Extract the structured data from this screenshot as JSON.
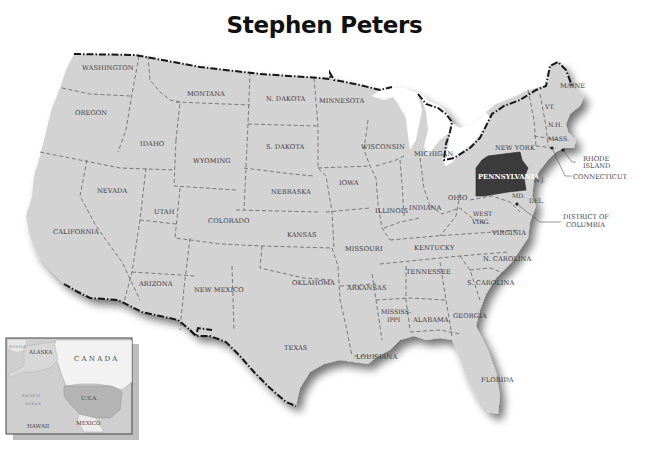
{
  "title": "Stephen Peters",
  "highlight": {
    "state": "PENNSYLVANIA",
    "fill": "#3b3b3b"
  },
  "colors": {
    "land": "#d2d2d2",
    "border": "#6a6a6a",
    "intl_border": "#1a1a1a",
    "background": "#ffffff"
  },
  "states": {
    "washington": "WASHINGTON",
    "oregon": "OREGON",
    "california": "CALIFORNIA",
    "nevada": "NEVADA",
    "idaho": "IDAHO",
    "montana": "MONTANA",
    "wyoming": "WYOMING",
    "utah": "UTAH",
    "arizona": "ARIZONA",
    "colorado": "COLORADO",
    "new_mexico": "NEW MEXICO",
    "n_dakota": "N. DAKOTA",
    "s_dakota": "S. DAKOTA",
    "nebraska": "NEBRASKA",
    "kansas": "KANSAS",
    "oklahoma": "OKLAHOMA",
    "texas": "TEXAS",
    "minnesota": "MINNESOTA",
    "iowa": "IOWA",
    "missouri": "MISSOURI",
    "arkansas": "ARKANSAS",
    "louisiana": "LOUISIANA",
    "wisconsin": "WISCONSIN",
    "illinois": "ILLINOIS",
    "michigan": "MICHIGAN",
    "indiana": "INDIANA",
    "ohio": "OHIO",
    "kentucky": "KENTUCKY",
    "tennessee": "TENNESSEE",
    "mississippi_1": "MISSISS-",
    "mississippi_2": "IPPI",
    "alabama": "ALABAMA",
    "georgia": "GEORGIA",
    "florida": "FLORIDA",
    "s_carolina": "S. CAROLINA",
    "n_carolina": "N. CAROLINA",
    "virginia": "VIRGINIA",
    "west_virg_1": "WEST",
    "west_virg_2": "VIRG.",
    "pennsylvania": "PENNSYLVANIA",
    "new_york": "NEW YORK",
    "vt": "VT.",
    "nh": "N.H.",
    "maine": "MAINE",
    "mass": "MASS.",
    "nj": "N.J.",
    "md": "MD.",
    "del": "DEL."
  },
  "callouts": {
    "rhode_island_1": "RHODE",
    "rhode_island_2": "ISLAND",
    "connecticut": "CONNECTICUT",
    "dc_1": "DISTRICT OF",
    "dc_2": "COLUMBIA"
  },
  "inset": {
    "russia": "RUSSIA",
    "alaska": "ALASKA",
    "canada": "CANADA",
    "usa": "U.S.A.",
    "pacific_1": "PACIFIC",
    "pacific_2": "OCEAN",
    "hawaii": "HAWAII",
    "mexico": "MEXICO"
  }
}
